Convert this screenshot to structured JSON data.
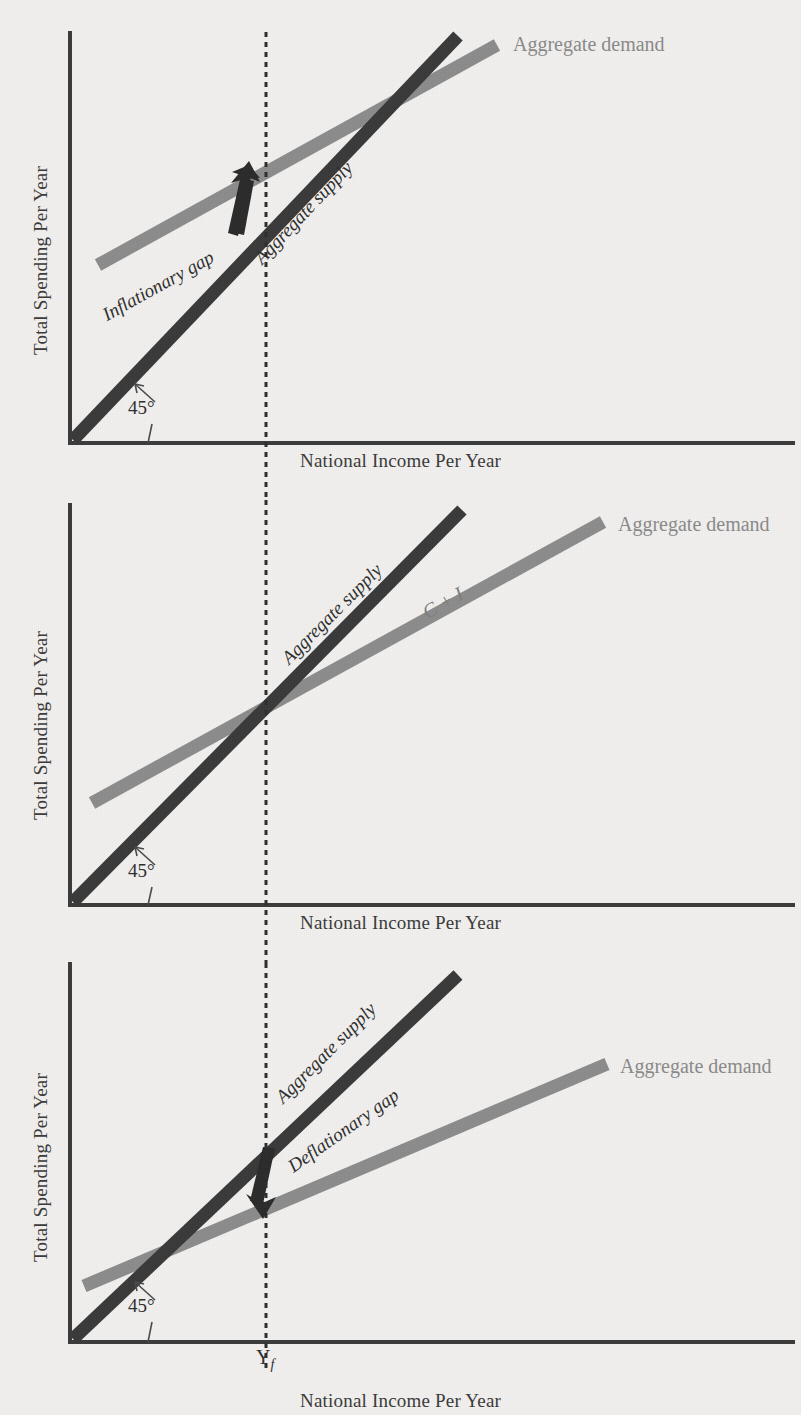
{
  "figure": {
    "kind": "keynesian-cross-three-panel",
    "background_color": "#f1f0ee",
    "supply_color": "#3a3a3a",
    "demand_color": "#8c8c8c",
    "axis_color": "#3b3b3b",
    "text_color": "#2f2f2f",
    "demand_label_color": "#8a8a8a",
    "full_employment_marker": "Y",
    "full_employment_subscript": "f"
  },
  "panels": [
    {
      "id": "panel-inflationary",
      "y_axis_title": "Total Spending Per Year",
      "x_axis_title": "National Income Per Year",
      "angle_label": "45°",
      "supply_label": "Aggregate supply",
      "demand_label": "Aggregate demand",
      "gap_label": "Inflationary gap",
      "gap_direction": "up",
      "description": "Aggregate demand lies above the 45-degree aggregate supply line at full-employment income, producing an inflationary gap."
    },
    {
      "id": "panel-equilibrium",
      "y_axis_title": "Total Spending Per Year",
      "x_axis_title": "National Income Per Year",
      "angle_label": "45°",
      "supply_label": "Aggregate supply",
      "demand_label": "Aggregate demand",
      "curve_label": "C + I",
      "gap_label": "",
      "gap_direction": "none",
      "description": "Aggregate demand (C + I) crosses the 45-degree aggregate supply line exactly at full-employment income."
    },
    {
      "id": "panel-deflationary",
      "y_axis_title": "Total Spending Per Year",
      "x_axis_title": "National Income Per Year",
      "angle_label": "45°",
      "supply_label": "Aggregate supply",
      "demand_label": "Aggregate demand",
      "gap_label": "Deflationary gap",
      "gap_direction": "down",
      "description": "Aggregate demand lies below the 45-degree aggregate supply line at full-employment income, producing a deflationary gap."
    }
  ],
  "chart_data": {
    "type": "line",
    "title": "",
    "xlabel": "National Income Per Year",
    "ylabel": "Total Spending Per Year",
    "xlim": [
      0,
      100
    ],
    "ylim": [
      0,
      100
    ],
    "grid": false,
    "legend_position": "inline-right",
    "annotations": [
      "45°",
      "Y_f",
      "Inflationary gap",
      "Deflationary gap",
      "C + I"
    ],
    "panels": [
      {
        "name": "Inflationary gap",
        "vertical_marker_x": 47,
        "series": [
          {
            "name": "Aggregate supply",
            "x": [
              0,
              100
            ],
            "y": [
              0,
              100
            ],
            "color": "#3a3a3a",
            "note": "45-degree line"
          },
          {
            "name": "Aggregate demand",
            "x": [
              8,
              100
            ],
            "y": [
              42,
              97
            ],
            "color": "#8c8c8c",
            "note": "lies above supply at Yf"
          }
        ]
      },
      {
        "name": "Equilibrium at full employment",
        "vertical_marker_x": 47,
        "series": [
          {
            "name": "Aggregate supply",
            "x": [
              0,
              100
            ],
            "y": [
              0,
              100
            ],
            "color": "#3a3a3a",
            "note": "45-degree line"
          },
          {
            "name": "Aggregate demand (C + I)",
            "x": [
              8,
              100
            ],
            "y": [
              25,
              78
            ],
            "color": "#8c8c8c",
            "note": "crosses supply at Yf"
          }
        ]
      },
      {
        "name": "Deflationary gap",
        "vertical_marker_x": 47,
        "series": [
          {
            "name": "Aggregate supply",
            "x": [
              0,
              100
            ],
            "y": [
              0,
              100
            ],
            "color": "#3a3a3a",
            "note": "45-degree line"
          },
          {
            "name": "Aggregate demand",
            "x": [
              2,
              100
            ],
            "y": [
              10,
              70
            ],
            "color": "#8c8c8c",
            "note": "lies below supply at Yf"
          }
        ]
      }
    ]
  }
}
